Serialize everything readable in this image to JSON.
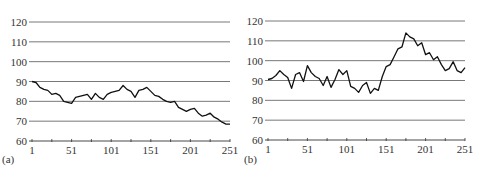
{
  "chart_data": [
    {
      "type": "line",
      "panel_label": "(a)",
      "title": "",
      "xlabel": "",
      "ylabel": "",
      "xlim": [
        1,
        251
      ],
      "ylim": [
        60,
        120
      ],
      "x_ticks": [
        1,
        51,
        101,
        151,
        201,
        251
      ],
      "y_ticks": [
        60,
        70,
        80,
        90,
        100,
        110,
        120
      ],
      "grid": "horizontal",
      "legend": "none",
      "series": [
        {
          "name": "series",
          "x": [
            1,
            6,
            11,
            16,
            21,
            26,
            31,
            36,
            41,
            46,
            51,
            56,
            61,
            66,
            71,
            76,
            81,
            86,
            91,
            96,
            101,
            106,
            111,
            116,
            121,
            126,
            131,
            136,
            141,
            146,
            151,
            156,
            161,
            166,
            171,
            176,
            181,
            186,
            191,
            196,
            201,
            206,
            211,
            216,
            221,
            226,
            231,
            236,
            241,
            246,
            251
          ],
          "values": [
            90,
            89.5,
            87,
            86,
            85.5,
            83.5,
            84,
            83,
            80,
            79.5,
            79,
            82,
            82.5,
            83,
            83.5,
            81,
            84,
            82,
            81,
            83.5,
            84.5,
            85,
            85.5,
            88,
            86,
            85,
            82,
            85.5,
            86,
            87,
            85,
            83,
            82.5,
            81,
            80,
            79.5,
            80,
            77,
            76,
            75,
            76,
            76.5,
            74,
            72.5,
            73,
            74,
            72,
            71,
            69.5,
            68.5,
            68.5
          ]
        }
      ]
    },
    {
      "type": "line",
      "panel_label": "(b)",
      "title": "",
      "xlabel": "",
      "ylabel": "",
      "xlim": [
        1,
        251
      ],
      "ylim": [
        60,
        120
      ],
      "x_ticks": [
        1,
        51,
        101,
        151,
        201,
        251
      ],
      "y_ticks": [
        60,
        70,
        80,
        90,
        100,
        110,
        120
      ],
      "grid": "horizontal",
      "legend": "none",
      "series": [
        {
          "name": "series",
          "x": [
            1,
            6,
            11,
            16,
            21,
            26,
            31,
            36,
            41,
            46,
            51,
            56,
            61,
            66,
            71,
            76,
            81,
            86,
            91,
            96,
            101,
            106,
            111,
            116,
            121,
            126,
            131,
            136,
            141,
            146,
            151,
            156,
            161,
            166,
            171,
            176,
            181,
            186,
            191,
            196,
            201,
            206,
            211,
            216,
            221,
            226,
            231,
            236,
            241,
            246,
            251
          ],
          "values": [
            90.5,
            91,
            92.5,
            95,
            93,
            91.5,
            86,
            93,
            94,
            89.5,
            97.5,
            94,
            92,
            91,
            87.5,
            92,
            86.5,
            90.5,
            95.5,
            93,
            95,
            87,
            86,
            84,
            87.5,
            89,
            83.5,
            86,
            85,
            92,
            97,
            98,
            102,
            106,
            107,
            114,
            112,
            111,
            107.5,
            109,
            103,
            104,
            100.5,
            102,
            98,
            95,
            96,
            99.5,
            95,
            94,
            96.5
          ]
        }
      ]
    }
  ],
  "panels": {
    "a": {
      "label": "(a)"
    },
    "b": {
      "label": "(b)"
    }
  }
}
